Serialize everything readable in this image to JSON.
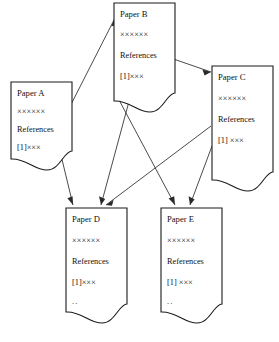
{
  "diagram": {
    "type": "node-link-diagram",
    "background_color": "#ffffff",
    "line_color": "#2a2a2a",
    "text_color": "#111111",
    "papers": [
      {
        "id": "A",
        "title": "Paper A",
        "body_line": "××××××",
        "references_label": "References",
        "citation_line": "[1]×××",
        "extra_line": "",
        "x": 11,
        "y": 82,
        "width": 61,
        "height": 77
      },
      {
        "id": "B",
        "title": "Paper B",
        "body_line": "××××××",
        "references_label": "References",
        "citation_line": "[1]×××",
        "extra_line": "",
        "x": 114,
        "y": 3,
        "width": 61,
        "height": 98
      },
      {
        "id": "C",
        "title": "Paper C",
        "body_line": "××××××",
        "references_label": "References",
        "citation_line": "[1] ×××",
        "extra_line": "",
        "x": 212,
        "y": 66,
        "width": 61,
        "height": 78
      },
      {
        "id": "D",
        "title": "Paper D",
        "body_line": "××××××",
        "references_label": "References",
        "citation_line": "[1]×××",
        "extra_line": "..",
        "x": 66,
        "y": 208,
        "width": 61,
        "height": 96
      },
      {
        "id": "E",
        "title": "Paper E",
        "body_line": "××××××",
        "references_label": "References",
        "citation_line": "[1] ×××",
        "extra_line": "..",
        "x": 161,
        "y": 208,
        "width": 61,
        "height": 96
      }
    ],
    "edges": [
      {
        "id": "a-to-b",
        "from": "A",
        "to": "B",
        "label": ""
      },
      {
        "id": "a-to-d",
        "from": "A",
        "to": "D",
        "label": ""
      },
      {
        "id": "b-to-c",
        "from": "B",
        "to": "C",
        "label": ""
      },
      {
        "id": "b-to-d",
        "from": "B",
        "to": "D",
        "label": ""
      },
      {
        "id": "b-to-e",
        "from": "B",
        "to": "E",
        "label": ""
      },
      {
        "id": "c-to-d",
        "from": "C",
        "to": "D",
        "label": ""
      },
      {
        "id": "c-to-e",
        "from": "C",
        "to": "E",
        "label": ""
      }
    ]
  }
}
